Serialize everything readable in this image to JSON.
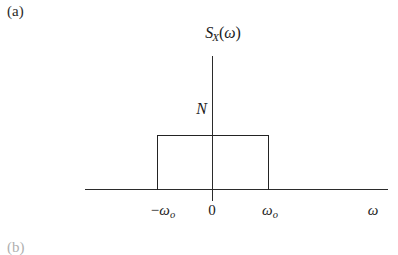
{
  "figure": {
    "panel_label": "(a)",
    "next_panel_label": "(b)",
    "axis_title": {
      "func": "S",
      "subscript": "X",
      "arg_open": "(",
      "arg": "ω",
      "arg_close": ")"
    },
    "amplitude_label": "N",
    "axis_x_label": "ω",
    "ticks": {
      "neg_cutoff": {
        "sign": "−",
        "symbol": "ω",
        "subscript": "o"
      },
      "origin": "0",
      "pos_cutoff": {
        "sign": "",
        "symbol": "ω",
        "subscript": "o"
      }
    },
    "colors": {
      "axis": "#2b2b2b",
      "curve": "#232323",
      "text": "#1b1b1b",
      "background": "#ffffff"
    }
  },
  "chart_data": {
    "type": "area",
    "xlabel": "ω",
    "ylabel": "S_X(ω)",
    "x": [
      -388,
      -269,
      -269,
      269,
      269,
      388
    ],
    "y": [
      0,
      0,
      1,
      1,
      0,
      0
    ],
    "plateau_value_label": "N",
    "cutoff_labels": [
      "-ω_o",
      "ω_o"
    ],
    "xtick_labels": [
      "−ω_o",
      "0",
      "ω_o"
    ],
    "ytick_labels": [
      "N"
    ],
    "grid": false,
    "legend": false,
    "axis_arrowheads": false
  }
}
